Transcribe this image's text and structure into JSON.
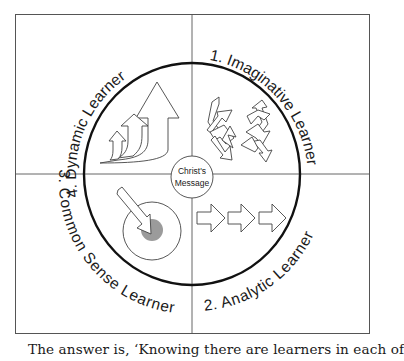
{
  "diagram": {
    "center": {
      "line1": "Christ's",
      "line2": "Message"
    },
    "quadrants": [
      {
        "id": "imaginative",
        "label": "1. Imaginative Learner",
        "icon": "tangled-arrows-icon"
      },
      {
        "id": "analytic",
        "label": "2. Analytic Learner",
        "icon": "sequential-arrows-icon"
      },
      {
        "id": "common-sense",
        "label": "3. Common Sense Learner",
        "icon": "target-arrow-icon"
      },
      {
        "id": "dynamic",
        "label": "4. Dynamic Learner",
        "icon": "rising-arrows-icon"
      }
    ],
    "colors": {
      "ring": "#111111",
      "grid": "#555555",
      "target_dot": "#9b9b9b",
      "outline": "#444444"
    }
  },
  "caption": "The answer is, ‘Knowing there are learners in each of"
}
